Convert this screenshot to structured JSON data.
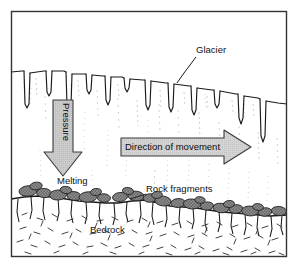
{
  "figure": {
    "type": "geological-cross-section",
    "frame": {
      "border_color": "#333333",
      "background_color": "#ffffff",
      "x": 11,
      "y": 11,
      "width": 276,
      "height": 246
    }
  },
  "labels": {
    "glacier": "Glacier",
    "pressure": "Pressure",
    "direction_of_movement": "Direction of movement",
    "melting": "Melting",
    "rock_fragments": "Rock fragments",
    "bedrock": "Bedrock"
  },
  "colors": {
    "line": "#1a1a1a",
    "ice_fill": "#ffffff",
    "ice_hairline": "#a9a9a9",
    "arrow_fill": "#c9c9c9",
    "arrow_stroke": "#3b3b3b",
    "banner_fill": "#d2d2d2",
    "rock_fill": "#8f8f8f",
    "rock_stroke": "#222222",
    "bedrock_fill": "#ffffff",
    "bedrock_texture": "#3a3a3a"
  },
  "regions": [
    {
      "name": "sky-above-glacier",
      "description": "blank white area above glacier surface"
    },
    {
      "name": "glacier-ice-body",
      "description": "ice mass with crevasses at top and faint vertical hairline texture"
    },
    {
      "name": "bedrock-body",
      "description": "bedrock below glacier with dash texture and vertical cracks"
    }
  ],
  "annotations": {
    "glacier_leader_line": {
      "from_x": 196,
      "from_y": 53,
      "to_x": 173,
      "to_y": 83
    },
    "melting_leader": {
      "present": false
    },
    "rock_fragments_leader": {
      "from_x": 168,
      "from_y": 193,
      "to_x": 148,
      "to_y": 200
    }
  },
  "pressure_arrow": {
    "direction": "down",
    "x": 63,
    "y_top": 100,
    "y_bottom": 176,
    "shaft_width": 20,
    "head_width": 37
  },
  "movement_arrow": {
    "direction": "right",
    "x_left": 121,
    "x_right": 251,
    "y_center": 147,
    "body_height": 17,
    "head_height": 35
  },
  "glacier_surface_points": "11,72 28,71 52,70 78,74 104,76 131,79 158,82 184,86 210,90 236,95 262,99 287,103",
  "crevasse_count": 12,
  "bedrock_contact_points": "11,199 38,196 66,199 92,202 118,203 146,200 170,206 196,208 222,212 248,214 270,216 287,215",
  "rock_fragment_count": 26
}
